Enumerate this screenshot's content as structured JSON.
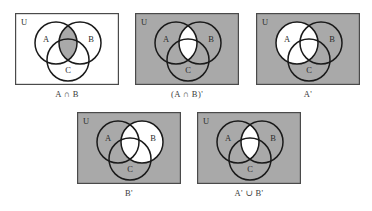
{
  "figure": {
    "universe_label": "U",
    "set_labels": {
      "a": "A",
      "b": "B",
      "c": "C"
    },
    "colors": {
      "shade": "#a9a9a9",
      "unshaded": "#ffffff",
      "stroke": "#1a1a1a",
      "border": "#4a4a4a",
      "text": "#2b2b2b",
      "caption_text": "#3a3a3a",
      "page_background": "#ffffff"
    },
    "panels": [
      {
        "id": "panel-1",
        "caption": "A ∩ B",
        "expression": "A ∩ B",
        "background": "unshaded",
        "shaded_regions": [
          "A∩B"
        ],
        "universe_label": "U",
        "labels": [
          "A",
          "B",
          "C"
        ]
      },
      {
        "id": "panel-2",
        "caption": "(A ∩ B)'",
        "expression": "(A ∩ B)'",
        "background": "shaded",
        "unshaded_regions": [
          "A∩B"
        ],
        "universe_label": "U",
        "labels": [
          "A",
          "B",
          "C"
        ]
      },
      {
        "id": "panel-3",
        "caption": "A'",
        "expression": "A'",
        "background": "shaded",
        "unshaded_regions": [
          "A"
        ],
        "universe_label": "U",
        "labels": [
          "A",
          "B",
          "C"
        ]
      },
      {
        "id": "panel-4",
        "caption": "B'",
        "expression": "B'",
        "background": "shaded",
        "unshaded_regions": [
          "B"
        ],
        "universe_label": "U",
        "labels": [
          "A",
          "B",
          "C"
        ]
      },
      {
        "id": "panel-5",
        "caption": "A' ∪ B'",
        "expression": "A' ∪ B'",
        "background": "shaded",
        "unshaded_regions": [
          "A∩B"
        ],
        "universe_label": "U",
        "labels": [
          "A",
          "B",
          "C"
        ]
      }
    ]
  }
}
